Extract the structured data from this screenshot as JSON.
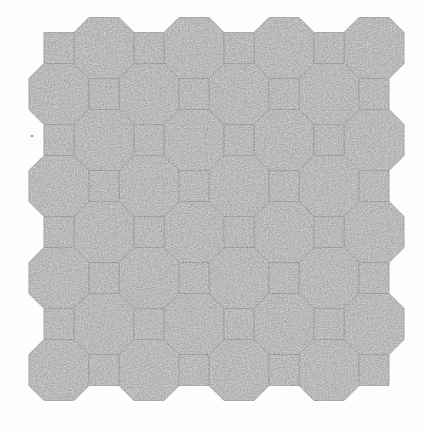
{
  "image": {
    "width": 423,
    "height": 428,
    "background_color": "#fdfdfd",
    "description": "scanned octagon-and-square tessellation (truncated square tiling) swatch, grainy gray tiles with faint darker joint lines"
  },
  "pattern": {
    "tile_fill": "#c6c6c6",
    "edge_color": "#818181",
    "edge_opacity": 0.6,
    "grain": {
      "base_frequency": 0.7,
      "octaves": 2,
      "seed": 11,
      "gray_scale": 0.55,
      "gray_offset": 0.4,
      "opacity": 0.5
    },
    "grid": {
      "octagon_width": 60,
      "octagon_height": 61,
      "square_width": 30,
      "square_height": 31,
      "flat_half_x": 15,
      "flat_half_y": 15.5,
      "columns_a": [
        104,
        194,
        284,
        374
      ],
      "columns_b": [
        59,
        149,
        239,
        329
      ],
      "band_centers_y": [
        48,
        94,
        140,
        186,
        232,
        278,
        324,
        370
      ],
      "octagons_per_band": 4,
      "squares_per_band": 4,
      "bands": 8
    },
    "speck": {
      "x": 32,
      "y": 136,
      "r": 1.3,
      "color": "#9a9a9a"
    }
  }
}
